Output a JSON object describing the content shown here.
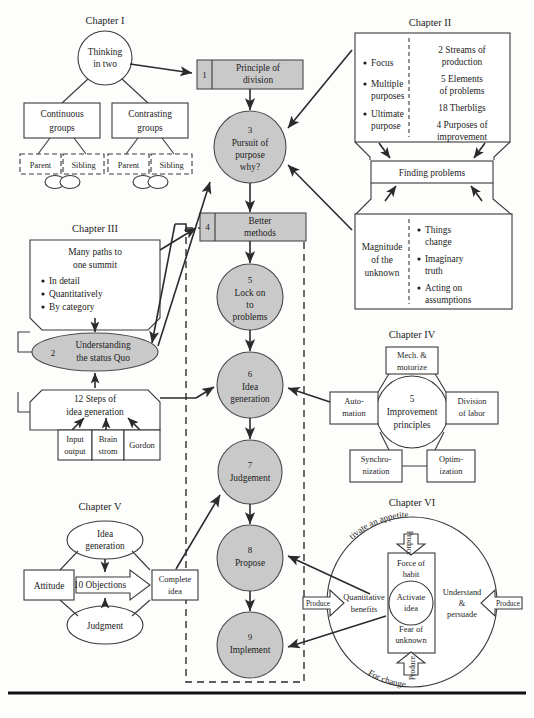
{
  "diagram": {
    "colors": {
      "shaded": "#c9c9c9",
      "stroke": "#3a3a3a",
      "background": "#fdfdfc"
    }
  },
  "chapter1": {
    "label": "Chapter I",
    "root": "Thinking\nin two",
    "root_l1": "Thinking",
    "root_l2": "in two",
    "left_box_l1": "Continuous",
    "left_box_l2": "groups",
    "right_box_l1": "Contrasting",
    "right_box_l2": "groups",
    "leaf_parent": "Parent",
    "leaf_sibling": "Sibling"
  },
  "chapter2": {
    "label": "Chapter II",
    "left_bullets": [
      "Focus",
      "Multiple",
      "purposes",
      "Ultimate",
      "purpose"
    ],
    "left_items": [
      "Focus",
      "Multiple purposes",
      "Ultimate purpose"
    ],
    "right_items": [
      "2 Streams of production",
      "5 Elements of problems",
      "18 Therbligs",
      "4 Purposes of improvement"
    ],
    "r1a": "2 Streams of",
    "r1b": "production",
    "r2a": "5 Elements",
    "r2b": "of problems",
    "r3a": "18 Therbligs",
    "r4a": "4 Purposes of",
    "r4b": "improvement",
    "middle_box": "Finding problems",
    "lower_left_a": "Magnitude",
    "lower_left_b": "of the",
    "lower_left_c": "unknown",
    "lower_right_items": [
      "Things change",
      "Imaginary truth",
      "Acting on assumptions"
    ],
    "lr1a": "Things",
    "lr1b": "change",
    "lr2a": "Imaginary",
    "lr2b": "truth",
    "lr3a": "Acting on",
    "lr3b": "assumptions"
  },
  "chapter3": {
    "label": "Chapter III",
    "top_a": "Many paths to",
    "top_b": "one summit",
    "bullets": [
      "In detail",
      "Quantitatively",
      "By category"
    ],
    "ellipse_num": "2",
    "ellipse_a": "Understanding",
    "ellipse_b": "the status Quo",
    "steps_a": "12 Steps of",
    "steps_b": "idea generation",
    "cells": [
      "Input output",
      "Brain strom",
      "Gordon"
    ],
    "cell1a": "Input",
    "cell1b": "output",
    "cell2a": "Brain",
    "cell2b": "strom",
    "cell3a": "Gordon"
  },
  "chapter4": {
    "label": "Chapter IV",
    "center_a": "5",
    "center_b": "Improvement",
    "center_c": "principles",
    "nodes": [
      "Mech. & motorize",
      "Automation",
      "Division of labor",
      "Synchronization",
      "Optimization"
    ],
    "n1a": "Mech. &",
    "n1b": "motorize",
    "n2a": "Auto-",
    "n2b": "mation",
    "n3a": "Division",
    "n3b": "of labor",
    "n4a": "Synchro-",
    "n4b": "nization",
    "n5a": "Optim-",
    "n5b": "ization"
  },
  "chapter5": {
    "label": "Chapter V",
    "top_a": "Idea",
    "top_b": "generation",
    "left": "Attitude",
    "center": "10 Objections",
    "right_a": "Complete",
    "right_b": "idea",
    "bottom": "Judgment"
  },
  "chapter6": {
    "label": "Chapter VI",
    "arc_top": "Cultivate an appetite",
    "arc_bottom": "For change",
    "produce_up": "Produce",
    "produce_down": "Produce",
    "produce_left": "Produce",
    "produce_right": "Produce",
    "force_a": "Force of",
    "force_b": "habit",
    "activate_a": "Activate",
    "activate_b": "idea",
    "fear_a": "Fear of",
    "fear_b": "unknown",
    "quant_a": "Quantitative",
    "quant_b": "benefits",
    "understand_a": "Understand",
    "understand_b": "&",
    "understand_c": "persuade"
  },
  "spine": {
    "step1_num": "1",
    "step1_a": "Principle of",
    "step1_b": "division",
    "step3_num": "3",
    "step3_a": "Pursuit of",
    "step3_b": "purpose",
    "step3_c": "why?",
    "step4_num": "4",
    "step4_a": "Better",
    "step4_b": "methods",
    "step5_num": "5",
    "step5_a": "Lock on",
    "step5_b": "to",
    "step5_c": "problems",
    "step6_num": "6",
    "step6_a": "Idea",
    "step6_b": "generation",
    "step7_num": "7",
    "step7_a": "Judgement",
    "step8_num": "8",
    "step8_a": "Propose",
    "step9_num": "9",
    "step9_a": "Implement"
  }
}
